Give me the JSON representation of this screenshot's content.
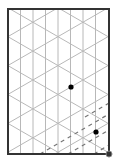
{
  "diagram": {
    "type": "isometric-grid",
    "frame": {
      "x": 8,
      "y": 9,
      "width": 101,
      "height": 145,
      "stroke": "#333333"
    },
    "grid": {
      "stroke": "#b8b8b8",
      "vertical_spacing": 12.5,
      "diagonal_slope": 0.577,
      "anchor_crossing": [
        83,
        80
      ],
      "diagonal_c_spacing": 28.9
    },
    "dashed_lines": {
      "stroke": "#777777",
      "segments": [
        [
          [
            85,
            117
          ],
          [
            109,
            103
          ]
        ],
        [
          [
            40,
            154
          ],
          [
            109,
            114
          ]
        ],
        [
          [
            68,
            154
          ],
          [
            109,
            130
          ]
        ],
        [
          [
            94,
            154
          ],
          [
            109,
            145
          ]
        ]
      ]
    },
    "points": [
      {
        "name": "point-a",
        "x": 71,
        "y": 87,
        "fill": "#000000"
      },
      {
        "name": "point-b",
        "x": 96,
        "y": 132,
        "fill": "#000000"
      },
      {
        "name": "corner-point",
        "x": 109,
        "y": 154,
        "fill": "#333333",
        "ring": "#888888"
      }
    ]
  }
}
